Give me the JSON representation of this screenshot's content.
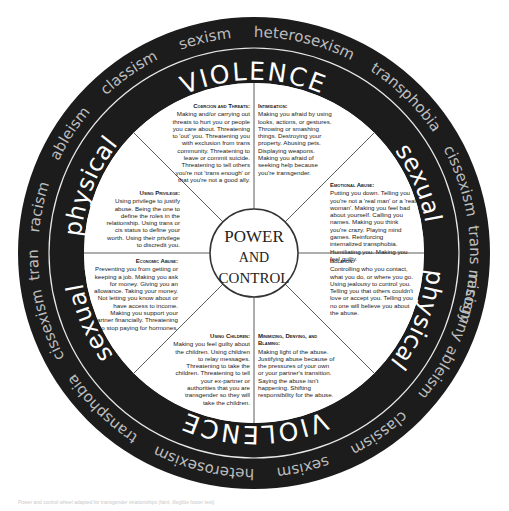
{
  "diagram": {
    "title": "Power and Control Wheel",
    "center": {
      "line1": "POWER",
      "line2": "AND",
      "line3": "CONTROL"
    },
    "colors": {
      "ring": "#1c1c1c",
      "ring_text_outer": "#bdbdbd",
      "ring_text_inner": "#ffffff",
      "lines": "#333333",
      "background": "#ffffff"
    },
    "outer_ring_words": [
      "heterosexism",
      "transphobia",
      "cissexism",
      "trans misogyny",
      "racism",
      "ableism",
      "classism",
      "sexism",
      "heterosexism",
      "transphobia",
      "cissexism",
      "trans misogyny",
      "racism",
      "ableism",
      "classism",
      "sexism"
    ],
    "inner_ring_words": {
      "top_violence": "VIOLENCE",
      "top_left_physical": "physical",
      "top_right_sexual": "sexual",
      "bottom_violence": "VIOLENCE",
      "bottom_right_physical": "physical",
      "bottom_left_sexual": "sexual"
    },
    "segments": [
      {
        "id": "coercion",
        "title": "Coercion and Threats:",
        "text": "Making and/or carrying out threats to hurt you or people you care about. Threatening to 'out' you. Threatening you with exclusion from trans community. Threatening to leave or commit suicide. Threatening to tell others you're not 'trans enough' or that you're not a good ally."
      },
      {
        "id": "intimidation",
        "title": "Intimidation:",
        "text": "Making you afraid by using looks, actions, or gestures. Throwing or smashing things. Destroying your property. Abusing pets. Displaying weapons. Making you afraid of seeking help because you're transgender."
      },
      {
        "id": "emotional",
        "title": "Emotional Abuse:",
        "text": "Putting you down. Telling you you're not a 'real man' or a 'real woman'. Making you feel bad about yourself. Calling you names. Making you think you're crazy. Playing mind games. Reinforcing internalized transphobia. Humiliating you. Making you feel guilty."
      },
      {
        "id": "isolation",
        "title": "Isolation:",
        "text": "Controlling who you contact, what you do, or where you go. Using jealousy to control you. Telling you that others couldn't love or accept you. Telling you no one will believe you about the abuse."
      },
      {
        "id": "minimizing",
        "title": "Minimizing, Denying, and Blaming:",
        "text": "Making light of the abuse. Justifying abuse because of the pressures of your own or your partner's transition. Saying the abuse isn't happening. Shifting responsibility for the abuse."
      },
      {
        "id": "children",
        "title": "Using Children:",
        "text": "Making you feel guilty about the children. Using children to relay messages. Threatening to take the children. Threatening to tell your ex-partner or authorities that you are transgender so they will take the children."
      },
      {
        "id": "economic",
        "title": "Economic Abuse:",
        "text": "Preventing you from getting or keeping a job. Making you ask for money. Giving you an allowance. Taking your money. Not letting you know about or have access to income. Making you support your partner financially. Threatening to stop paying for hormones."
      },
      {
        "id": "privilege",
        "title": "Using Privilege:",
        "text": "Using privilege to justify abuse. Being the one to define the roles in the relationship. Using trans or cis status to define your worth. Using their privilege to discredit you."
      }
    ],
    "caption": "Power and control wheel adapted for transgender relationships (faint, illegible footer text)"
  }
}
